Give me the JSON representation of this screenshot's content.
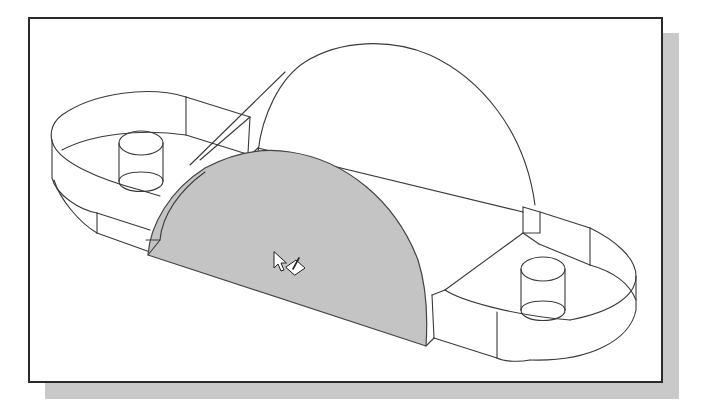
{
  "figure": {
    "colors": {
      "background": "#ffffff",
      "frame_border": "#2a2a2a",
      "shadow": "#c9c9c9",
      "line": "#3a3a3a",
      "selected_face": "#c4c4c4",
      "cursor_fill": "#ffffff",
      "cursor_stroke": "#222222"
    },
    "elements": {
      "base_plate": "rounded-end base plate (wireframe)",
      "left_boss": "left cylindrical boss",
      "right_boss": "right cylindrical boss",
      "rib_back_arc": "back arc of half-cylinder rib",
      "rib_front_face": "front semicircular face (selected, shaded)",
      "cursor": "arrow pointer with sketch-plane icon"
    }
  }
}
